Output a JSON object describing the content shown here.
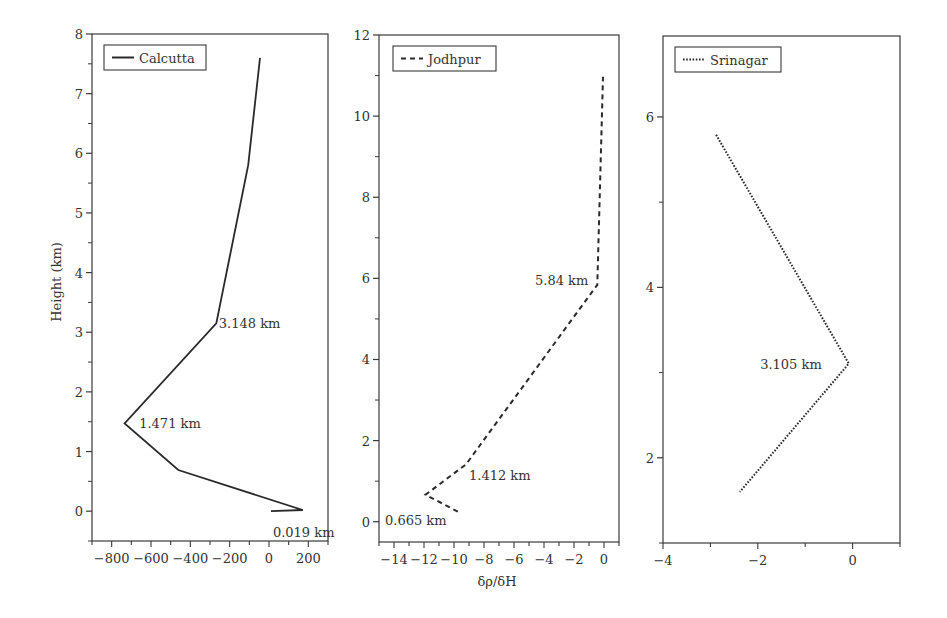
{
  "figure": {
    "ylabel": "Height (km)",
    "xlabel": "δρ/δH"
  },
  "chart_data": [
    {
      "type": "line",
      "panel": "left",
      "title": "",
      "legend": "Calcutta",
      "line_style": "solid",
      "xlabel": "",
      "ylabel": "Height (km)",
      "xlim": [
        -900,
        300
      ],
      "ylim": [
        -0.5,
        8
      ],
      "xticks": [
        -800,
        -600,
        -400,
        -200,
        0,
        200
      ],
      "xtick_labels": [
        "−800",
        "−600",
        "−400",
        "−200",
        "0",
        "200"
      ],
      "yticks": [
        0,
        1,
        2,
        3,
        4,
        5,
        6,
        7,
        8
      ],
      "ytick_labels": [
        "0",
        "1",
        "2",
        "3",
        "4",
        "5",
        "6",
        "7",
        "8"
      ],
      "x": [
        10,
        172,
        -461,
        -734,
        -268,
        -106,
        -46
      ],
      "y": [
        0.0,
        0.019,
        0.69,
        1.471,
        3.148,
        5.8,
        7.6
      ],
      "annotations": [
        {
          "text": "0.019 km",
          "x": 20,
          "y": -0.35
        },
        {
          "text": "1.471 km",
          "x": -660,
          "y": 1.471
        },
        {
          "text": "3.148 km",
          "x": -255,
          "y": 3.148
        }
      ],
      "legend_position": "upper left",
      "grid": false
    },
    {
      "type": "line",
      "panel": "middle",
      "title": "",
      "legend": "Jodhpur",
      "line_style": "dashed",
      "xlabel": "δρ/δH",
      "ylabel": "",
      "xlim": [
        -15,
        1
      ],
      "ylim": [
        -0.5,
        12
      ],
      "xticks": [
        -14,
        -12,
        -10,
        -8,
        -6,
        -4,
        -2,
        0
      ],
      "xtick_labels": [
        "−14",
        "−12",
        "−10",
        "−8",
        "−6",
        "−4",
        "−2",
        "0"
      ],
      "yticks": [
        0,
        2,
        4,
        6,
        8,
        10,
        12
      ],
      "ytick_labels": [
        "0",
        "2",
        "4",
        "6",
        "8",
        "10",
        "12"
      ],
      "x": [
        -9.75,
        -11.9,
        -9.2,
        -0.45,
        -0.07
      ],
      "y": [
        0.25,
        0.665,
        1.412,
        5.84,
        10.97
      ],
      "annotations": [
        {
          "text": "0.665 km",
          "x": -14.6,
          "y": 0.05
        },
        {
          "text": "1.412 km",
          "x": -9.0,
          "y": 1.15
        },
        {
          "text": "5.84 km",
          "x": -4.6,
          "y": 5.95
        }
      ],
      "legend_position": "upper left",
      "grid": false
    },
    {
      "type": "line",
      "panel": "right",
      "title": "",
      "legend": "Srinagar",
      "line_style": "dotted",
      "xlabel": "",
      "ylabel": "",
      "xlim": [
        -4,
        1
      ],
      "ylim": [
        1,
        6.95
      ],
      "xticks": [
        -4,
        -2,
        0
      ],
      "xtick_labels": [
        "−4",
        "−2",
        "0"
      ],
      "yticks": [
        2,
        4,
        6
      ],
      "ytick_labels": [
        "2",
        "4",
        "6"
      ],
      "x": [
        -2.88,
        -0.08,
        -2.38
      ],
      "y": [
        5.79,
        3.105,
        1.6
      ],
      "annotations": [
        {
          "text": "3.105 km",
          "x": -1.95,
          "y": 3.1
        }
      ],
      "legend_position": "upper left",
      "grid": false
    }
  ],
  "panels": [
    {
      "legend": "Calcutta",
      "annotations": [
        "0.019 km",
        "1.471 km",
        "3.148 km"
      ]
    },
    {
      "legend": "Jodhpur",
      "annotations": [
        "0.665 km",
        "1.412 km",
        "5.84 km"
      ]
    },
    {
      "legend": "Srinagar",
      "annotations": [
        "3.105 km"
      ]
    }
  ],
  "style": {
    "line_color": "#2a2a2a",
    "axis_color": "#3a3a3a",
    "text_color": "#333333",
    "background": "#ffffff"
  }
}
